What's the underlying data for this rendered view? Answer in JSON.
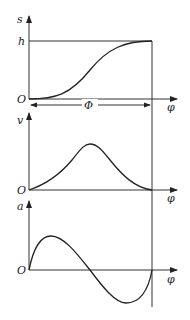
{
  "diagram": {
    "colors": {
      "line": "#222222",
      "background": "#ffffff"
    },
    "panels": [
      {
        "id": "displacement",
        "y_axis_label": "s",
        "x_axis_label": "φ",
        "origin_label": "O",
        "level_label": "h",
        "span_label": "Φ",
        "curve": "monotonic S-curve rising from 0 to h over Φ"
      },
      {
        "id": "velocity",
        "y_axis_label": "v",
        "x_axis_label": "φ",
        "origin_label": "O",
        "curve": "bell-shaped pulse, zero at both ends, peak at Φ/2"
      },
      {
        "id": "acceleration",
        "y_axis_label": "a",
        "x_axis_label": "φ",
        "origin_label": "O",
        "curve": "one full sine period: positive hump then negative trough, zero at 0, Φ/2, Φ"
      }
    ]
  }
}
